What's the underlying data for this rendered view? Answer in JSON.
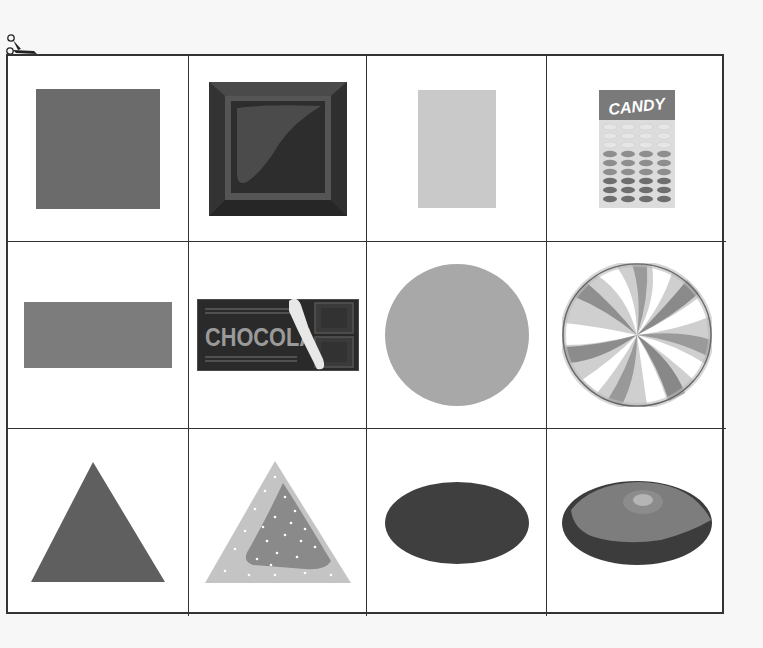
{
  "worksheet": {
    "scissors_icon": "scissors-icon",
    "rows": [
      {
        "shape": "square",
        "cells": [
          {
            "kind": "shape",
            "name": "square",
            "color": "#6b6b6b"
          },
          {
            "kind": "object",
            "name": "chocolate-square",
            "color": "#2e2e2e"
          },
          {
            "kind": "shape",
            "name": "rectangle-vertical",
            "color": "#c9c9c9"
          },
          {
            "kind": "object",
            "name": "candy-box",
            "label": "CANDY",
            "color": "#7a7a7a"
          }
        ]
      },
      {
        "shape": "rectangle-and-circle",
        "cells": [
          {
            "kind": "shape",
            "name": "rectangle-horizontal",
            "color": "#7c7c7c"
          },
          {
            "kind": "object",
            "name": "chocolate-bar",
            "label": "CHOCOLA",
            "color": "#2c2c2c"
          },
          {
            "kind": "shape",
            "name": "circle",
            "color": "#a8a8a8"
          },
          {
            "kind": "object",
            "name": "peppermint-swirl-candy",
            "color": "#8a8a8a"
          }
        ]
      },
      {
        "shape": "triangle-and-oval",
        "cells": [
          {
            "kind": "shape",
            "name": "triangle",
            "color": "#5f5f5f"
          },
          {
            "kind": "object",
            "name": "triangle-sprinkle-cookie",
            "color": "#bdbdbd"
          },
          {
            "kind": "shape",
            "name": "oval",
            "color": "#3f3f3f"
          },
          {
            "kind": "object",
            "name": "oval-jelly-bean",
            "color": "#7d7d7d"
          }
        ]
      }
    ]
  },
  "labels": {
    "candy_box_text": "CANDY",
    "chocolate_bar_text": "CHOCOLA"
  }
}
